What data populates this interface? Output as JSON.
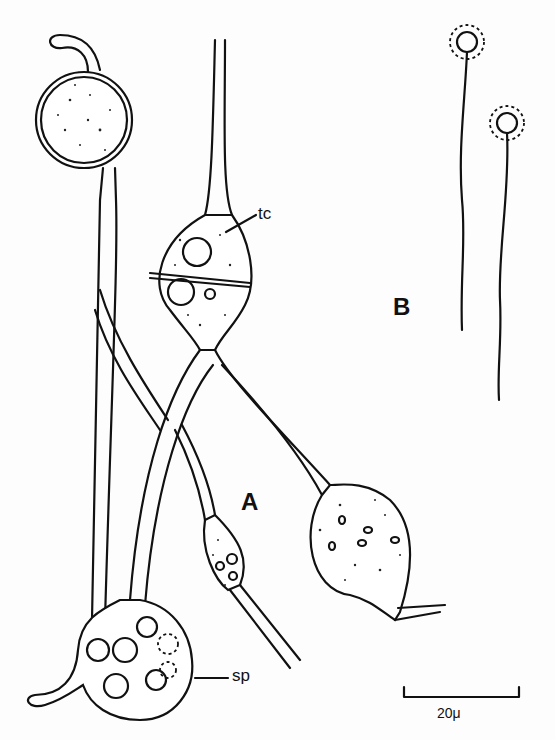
{
  "figure": {
    "panels": [
      {
        "id": "A",
        "label": "A"
      },
      {
        "id": "B",
        "label": "B"
      }
    ],
    "annotations": {
      "tc": "tc",
      "sp": "sp"
    },
    "scale_bar": {
      "label": "20μ",
      "length_px": 115
    },
    "colors": {
      "ink": "#111111",
      "background": "#fdfdfd"
    }
  }
}
